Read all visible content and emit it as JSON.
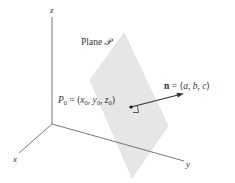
{
  "diagram": {
    "axes": {
      "x_label": "x",
      "y_label": "y",
      "z_label": "z"
    },
    "plane": {
      "label_prefix": "Plane ",
      "label_symbol": "𝒫",
      "fill_color": "#e6e6e6",
      "edge_color": "#d8d8d8"
    },
    "point": {
      "name": "P",
      "subscript": "0",
      "equals": " = (",
      "coords": [
        {
          "var": "x",
          "sub": "0"
        },
        {
          "var": "y",
          "sub": "0"
        },
        {
          "var": "z",
          "sub": "0"
        }
      ],
      "close": ")"
    },
    "normal": {
      "symbol": "n",
      "equals": " = ",
      "open": "⟨",
      "components": [
        "a",
        "b",
        "c"
      ],
      "close": "⟩",
      "color": "#333333"
    },
    "axis_color": "#555555"
  }
}
